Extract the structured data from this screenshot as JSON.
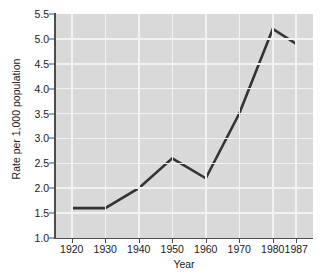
{
  "chart_data": {
    "type": "line",
    "title": "",
    "xlabel": "Year",
    "ylabel": "Rate per 1,000 population",
    "x": [
      1920,
      1930,
      1940,
      1950,
      1960,
      1970,
      1980,
      1987
    ],
    "xtick_labels": [
      "1920",
      "1930",
      "1940",
      "1950",
      "1960",
      "1970",
      "1980",
      "1987"
    ],
    "values": [
      1.6,
      1.6,
      2.0,
      2.6,
      2.2,
      3.5,
      5.2,
      4.9
    ],
    "ytick_labels": [
      "1.0",
      "1.5",
      "2.0",
      "2.5",
      "3.0",
      "3.5",
      "4.0",
      "4.5",
      "5.0",
      "5.5"
    ],
    "yticks": [
      1.0,
      1.5,
      2.0,
      2.5,
      3.0,
      3.5,
      4.0,
      4.5,
      5.0,
      5.5
    ],
    "ylim": [
      1.0,
      5.5
    ],
    "xlim": [
      1915,
      1992
    ],
    "grid": true,
    "legend": null,
    "series": [
      {
        "name": "Rate per 1,000 population",
        "values": [
          1.6,
          1.6,
          2.0,
          2.6,
          2.2,
          3.5,
          5.2,
          4.9
        ]
      }
    ],
    "colors": {
      "line": "#333333",
      "plot_background": "#d9d9d9",
      "gridline": "#f2f2f2",
      "axis": "#4d4d4d",
      "text": "#1a1a1a",
      "figure_background": "#ffffff"
    }
  }
}
